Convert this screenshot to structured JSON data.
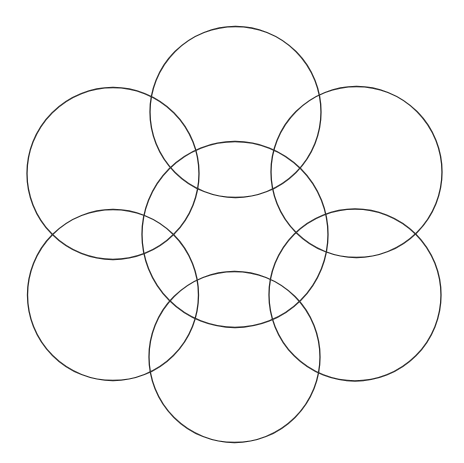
{
  "diagram": {
    "type": "overlapping-circles",
    "width": 464,
    "height": 463,
    "background": "#ffffff",
    "stroke": "#2b2b2b",
    "stroke_width": 1.3,
    "circles": [
      {
        "name": "top",
        "cx": 235.5,
        "cy": 112,
        "r": 85.5
      },
      {
        "name": "upper-left",
        "cx": 113,
        "cy": 173.5,
        "r": 86
      },
      {
        "name": "upper-right",
        "cx": 356.5,
        "cy": 172,
        "r": 85.5
      },
      {
        "name": "center",
        "cx": 235,
        "cy": 234.5,
        "r": 93
      },
      {
        "name": "lower-left",
        "cx": 113,
        "cy": 295,
        "r": 85.5
      },
      {
        "name": "lower-right",
        "cx": 355,
        "cy": 295,
        "r": 86
      },
      {
        "name": "bottom",
        "cx": 234.5,
        "cy": 357,
        "r": 85.5
      }
    ]
  }
}
